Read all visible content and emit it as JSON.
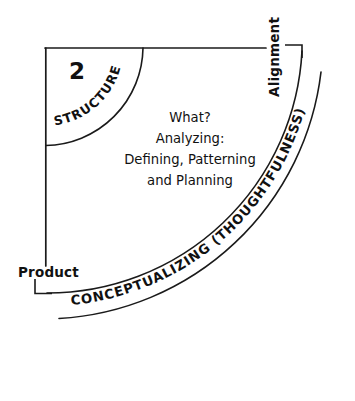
{
  "diagram": {
    "stage_number": "2",
    "inner_arc_label": "STRUCTURE",
    "outer_arc_label": "CONCEPTUALIZING (THOUGHTFULNESS)",
    "vertical_axis_label": "Alignment",
    "horizontal_axis_label": "Product",
    "center_text": {
      "line1": "What?",
      "line2": "Analyzing:",
      "line3": "Defining, Patterning",
      "line4": "and Planning"
    },
    "colors": {
      "ink": "#1a1a1a",
      "text": "#111111",
      "background": "#ffffff"
    }
  }
}
